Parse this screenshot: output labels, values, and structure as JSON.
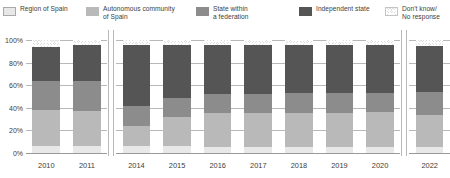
{
  "legend": {
    "items": [
      {
        "label": "Region of Spain",
        "color": "#e8e8e8",
        "pattern": "solid",
        "border": "#a9a9a9"
      },
      {
        "label": "Autonomous community\nof Spain",
        "color": "#b9b9b9",
        "pattern": "solid",
        "border": "#b9b9b9"
      },
      {
        "label": "State within\na federation",
        "color": "#8c8c8c",
        "pattern": "solid",
        "border": "#8c8c8c"
      },
      {
        "label": "Independent state",
        "color": "#555555",
        "pattern": "solid",
        "border": "#555555"
      },
      {
        "label": "Don't know/\nNo response",
        "color": "#dcdcdc",
        "pattern": "hatch",
        "border": "#c4c4c4"
      }
    ]
  },
  "chart_data": {
    "type": "bar",
    "title": "",
    "xlabel": "",
    "ylabel": "",
    "stacked": true,
    "normalized": "100%",
    "ylim": [
      0,
      100
    ],
    "yticks": [
      0,
      20,
      40,
      60,
      80,
      100
    ],
    "ytick_labels": [
      "0%",
      "20%",
      "40%",
      "60%",
      "80%",
      "100%"
    ],
    "grid": true,
    "legend_position": "top",
    "axis_breaks": [
      {
        "after_category": "2011"
      },
      {
        "after_category": "2020"
      }
    ],
    "categories": [
      "2010",
      "2011",
      "2014",
      "2015",
      "2016",
      "2017",
      "2018",
      "2019",
      "2020",
      "2022"
    ],
    "series": [
      {
        "name": "Region of Spain",
        "color": "#e8e8e8",
        "values": [
          6,
          6,
          6,
          6,
          5,
          5,
          5,
          5,
          5,
          5
        ]
      },
      {
        "name": "Autonomous community of Spain",
        "color": "#b9b9b9",
        "values": [
          32,
          31,
          18,
          26,
          30,
          30,
          30,
          30,
          31,
          29
        ]
      },
      {
        "name": "State within a federation",
        "color": "#8c8c8c",
        "values": [
          26,
          27,
          18,
          17,
          17,
          17,
          18,
          18,
          17,
          20
        ]
      },
      {
        "name": "Independent state",
        "color": "#555555",
        "values": [
          30,
          32,
          54,
          47,
          44,
          44,
          43,
          43,
          43,
          41
        ]
      },
      {
        "name": "Don't know/No response",
        "color": "#dcdcdc",
        "values": [
          6,
          4,
          4,
          4,
          4,
          4,
          4,
          4,
          4,
          5
        ]
      }
    ]
  }
}
